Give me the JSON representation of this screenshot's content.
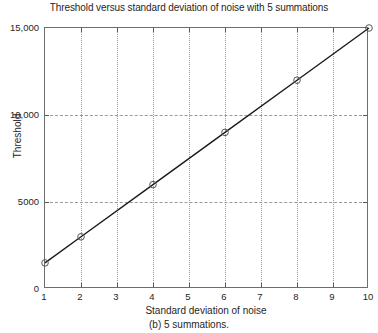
{
  "figure": {
    "caption": "(b) 5 summations."
  },
  "chart_data": {
    "type": "line",
    "title": "Threshold versus standard deviation of noise with 5 summations",
    "xlabel": "Standard deviation of noise",
    "ylabel": "Threshold",
    "xlim": [
      1,
      10
    ],
    "ylim": [
      0,
      15000
    ],
    "grid": true,
    "legend": "none",
    "marker": "circle-open",
    "line_color": "#1a1a1a",
    "grid_color": "#9a9a9a",
    "axis_color": "#6d6d6d",
    "x": [
      1,
      2,
      4,
      6,
      8,
      10
    ],
    "values": [
      1500,
      3000,
      6000,
      9000,
      12000,
      15000
    ],
    "series": [
      {
        "name": "Threshold",
        "x": [
          1,
          2,
          4,
          6,
          8,
          10
        ],
        "values": [
          1500,
          3000,
          6000,
          9000,
          12000,
          15000
        ]
      }
    ],
    "xticks": [
      1,
      2,
      3,
      4,
      5,
      6,
      7,
      8,
      9,
      10
    ],
    "xticklabels": [
      "1",
      "2",
      "3",
      "4",
      "5",
      "6",
      "7",
      "8",
      "9",
      "10"
    ],
    "yticks": [
      0,
      5000,
      10000,
      15000
    ],
    "yticklabels": [
      "0",
      "5000",
      "10,000",
      "15,000"
    ]
  }
}
